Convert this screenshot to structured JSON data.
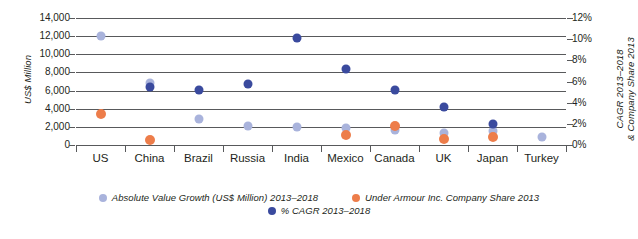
{
  "chart_data": {
    "type": "scatter",
    "title": "",
    "categories": [
      "US",
      "China",
      "Brazil",
      "Russia",
      "India",
      "Mexico",
      "Canada",
      "UK",
      "Japan",
      "Turkey"
    ],
    "ylabel_left": "US$ Million",
    "ylabel_right_line1": "CAGR 2013–2018",
    "ylabel_right_line2": "& Company Share 2013",
    "ylim_left": [
      0,
      14000
    ],
    "ylim_right": [
      0,
      12
    ],
    "yticks_left": [
      "14,000",
      "12,000",
      "10,000",
      "8,000",
      "6,000",
      "4,000",
      "2,000",
      "0"
    ],
    "yticks_right": [
      "12%",
      "10%",
      "8%",
      "6%",
      "4%",
      "2%",
      "0%"
    ],
    "grid": true,
    "legend_position": "bottom",
    "series": [
      {
        "name": "Absolute Value Growth (US$ Million) 2013–2018",
        "key": "abs",
        "color": "#a9b3dc",
        "axis": "left",
        "values": [
          12000,
          6800,
          2900,
          2100,
          1950,
          1900,
          1700,
          1300,
          1550,
          900
        ]
      },
      {
        "name": "Under Armour Inc. Company Share 2013",
        "key": "ua",
        "color": "#ed7d4a",
        "axis": "right",
        "values": [
          2.9,
          0.5,
          null,
          null,
          null,
          0.9,
          1.8,
          0.6,
          0.8,
          null
        ]
      },
      {
        "name": "% CAGR 2013–2018",
        "key": "cagr",
        "color": "#3a4a9e",
        "axis": "right",
        "values": [
          null,
          5.5,
          5.2,
          5.8,
          10.1,
          7.2,
          5.2,
          3.6,
          2.0,
          null
        ]
      }
    ]
  },
  "legend": {
    "items": [
      {
        "label": "Absolute Value Growth (US$ Million) 2013–2018",
        "color": "#a9b3dc"
      },
      {
        "label": "Under Armour Inc. Company Share 2013",
        "color": "#ed7d4a"
      },
      {
        "label": "% CAGR 2013–2018",
        "color": "#3a4a9e"
      }
    ]
  }
}
